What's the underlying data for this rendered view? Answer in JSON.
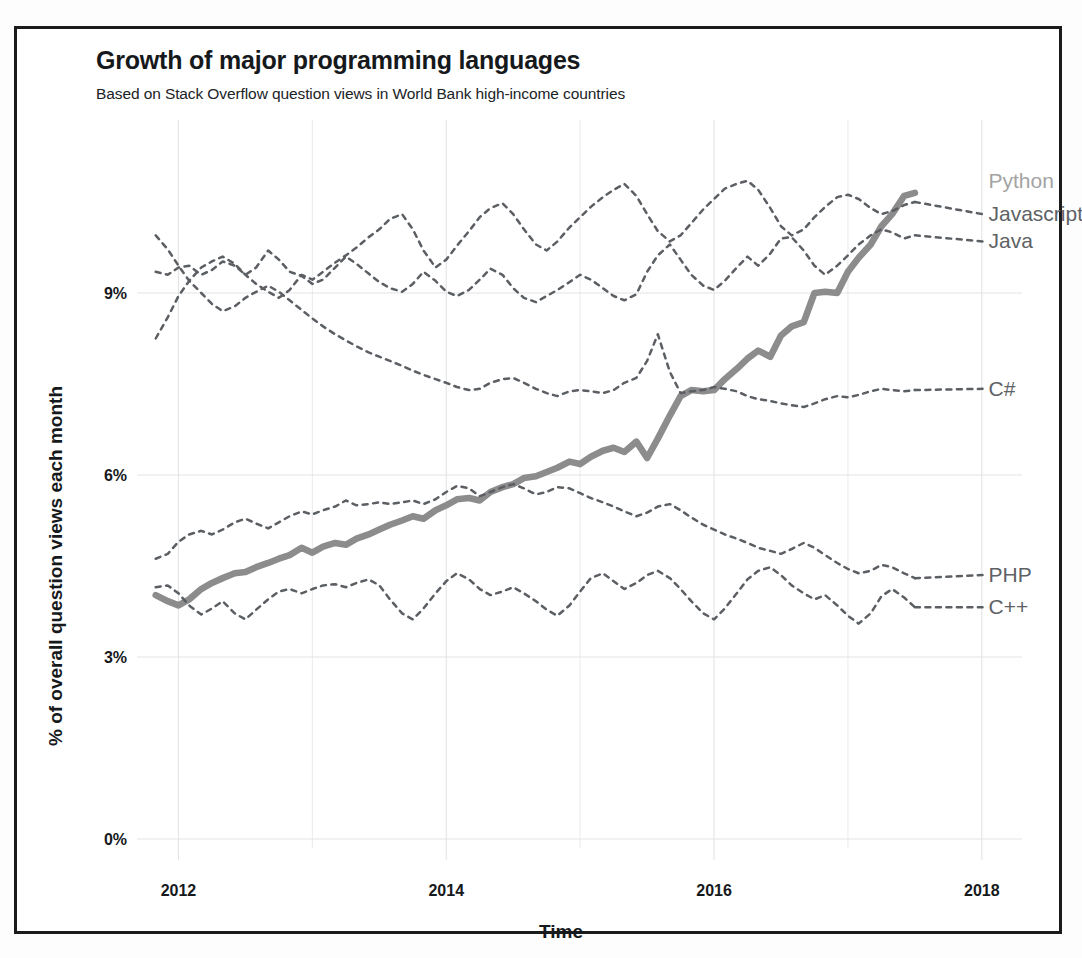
{
  "header": {
    "title": "Growth of major programming languages",
    "subtitle": "Based on Stack Overflow question views in World Bank high-income countries"
  },
  "axes": {
    "x_title": "Time",
    "y_title": "% of overall question views each month",
    "x_ticks": [
      "2012",
      "2014",
      "2016",
      "2018"
    ],
    "y_ticks": [
      "9%",
      "6%",
      "3%",
      "0%"
    ]
  },
  "series_labels": {
    "python": "Python",
    "javascript": "Javascript",
    "java": "Java",
    "csharp": "C#",
    "php": "PHP",
    "cpp": "C++"
  },
  "colors": {
    "python_line": "#8c8c8c",
    "dashed_line": "#5b5f63",
    "label_python": "#a3a3a3",
    "label_dark": "#5e6266",
    "grid": "#e4e4e6",
    "text": "#16191c",
    "frame": "#1b1b1b"
  },
  "chart_data": {
    "type": "line",
    "title": "Growth of major programming languages",
    "subtitle": "Based on Stack Overflow question views in World Bank high-income countries",
    "xlabel": "Time",
    "ylabel": "% of overall question views each month",
    "xlim": [
      2011.75,
      2018.3
    ],
    "ylim": [
      0,
      11.4
    ],
    "x_ticks": [
      2012,
      2014,
      2016,
      2018
    ],
    "x_minor_ticks": [
      2013,
      2015,
      2017
    ],
    "y_ticks": [
      0,
      3,
      6,
      9
    ],
    "grid": true,
    "legend_position": "right-inline-labels",
    "x_unit": "year (monthly samples)",
    "y_unit": "percent",
    "series": [
      {
        "name": "Python",
        "style": "solid-thick",
        "color": "#8c8c8c",
        "label_at": [
          2018.05,
          10.85
        ],
        "x": [
          2011.83,
          2011.92,
          2012.0,
          2012.08,
          2012.17,
          2012.25,
          2012.33,
          2012.42,
          2012.5,
          2012.58,
          2012.67,
          2012.75,
          2012.83,
          2012.92,
          2013.0,
          2013.08,
          2013.17,
          2013.25,
          2013.33,
          2013.42,
          2013.5,
          2013.58,
          2013.67,
          2013.75,
          2013.83,
          2013.92,
          2014.0,
          2014.08,
          2014.17,
          2014.25,
          2014.33,
          2014.42,
          2014.5,
          2014.58,
          2014.67,
          2014.75,
          2014.83,
          2014.92,
          2015.0,
          2015.08,
          2015.17,
          2015.25,
          2015.33,
          2015.42,
          2015.5,
          2015.58,
          2015.67,
          2015.75,
          2015.83,
          2015.92,
          2016.0,
          2016.08,
          2016.17,
          2016.25,
          2016.33,
          2016.42,
          2016.5,
          2016.58,
          2016.67,
          2016.75,
          2016.83,
          2016.92,
          2017.0,
          2017.08,
          2017.17,
          2017.25,
          2017.33,
          2017.42,
          2017.5
        ],
        "y": [
          4.02,
          3.92,
          3.85,
          3.95,
          4.12,
          4.22,
          4.3,
          4.38,
          4.4,
          4.48,
          4.55,
          4.62,
          4.68,
          4.8,
          4.72,
          4.82,
          4.88,
          4.85,
          4.95,
          5.02,
          5.1,
          5.18,
          5.25,
          5.32,
          5.28,
          5.42,
          5.5,
          5.6,
          5.62,
          5.58,
          5.72,
          5.8,
          5.85,
          5.95,
          5.98,
          6.05,
          6.12,
          6.22,
          6.18,
          6.3,
          6.4,
          6.45,
          6.38,
          6.55,
          6.28,
          6.6,
          6.98,
          7.3,
          7.4,
          7.38,
          7.4,
          7.58,
          7.75,
          7.92,
          8.05,
          7.95,
          8.3,
          8.45,
          8.52,
          9.0,
          9.02,
          9.0,
          9.35,
          9.58,
          9.8,
          10.1,
          10.3,
          10.6,
          10.65
        ]
      },
      {
        "name": "Javascript",
        "style": "dashed",
        "color": "#5b5f63",
        "label_at": [
          2018.05,
          10.3
        ],
        "x": [
          2011.83,
          2011.92,
          2012.0,
          2012.08,
          2012.17,
          2012.25,
          2012.33,
          2012.42,
          2012.5,
          2012.58,
          2012.67,
          2012.75,
          2012.83,
          2012.92,
          2013.0,
          2013.08,
          2013.17,
          2013.25,
          2013.33,
          2013.42,
          2013.5,
          2013.58,
          2013.67,
          2013.75,
          2013.83,
          2013.92,
          2014.0,
          2014.08,
          2014.17,
          2014.25,
          2014.33,
          2014.42,
          2014.5,
          2014.58,
          2014.67,
          2014.75,
          2014.83,
          2014.92,
          2015.0,
          2015.08,
          2015.17,
          2015.25,
          2015.33,
          2015.42,
          2015.5,
          2015.58,
          2015.67,
          2015.75,
          2015.83,
          2015.92,
          2016.0,
          2016.08,
          2016.17,
          2016.25,
          2016.33,
          2016.42,
          2016.5,
          2016.58,
          2016.67,
          2016.75,
          2016.83,
          2016.92,
          2017.0,
          2017.08,
          2017.17,
          2017.25,
          2017.33,
          2017.42,
          2017.5
        ],
        "y": [
          8.25,
          8.6,
          8.95,
          9.2,
          9.42,
          9.52,
          9.6,
          9.48,
          9.3,
          9.15,
          9.02,
          8.92,
          9.05,
          9.3,
          9.22,
          9.35,
          9.5,
          9.62,
          9.75,
          9.92,
          10.05,
          10.22,
          10.3,
          10.05,
          9.7,
          9.42,
          9.55,
          9.78,
          10.02,
          10.25,
          10.4,
          10.48,
          10.3,
          10.05,
          9.8,
          9.7,
          9.85,
          10.08,
          10.25,
          10.42,
          10.58,
          10.7,
          10.8,
          10.6,
          10.3,
          10.02,
          9.85,
          9.95,
          10.15,
          10.38,
          10.55,
          10.72,
          10.8,
          10.85,
          10.7,
          10.4,
          10.1,
          9.95,
          10.05,
          10.25,
          10.42,
          10.58,
          10.62,
          10.55,
          10.4,
          10.3,
          10.35,
          10.45,
          10.5
        ]
      },
      {
        "name": "Java",
        "style": "dashed",
        "color": "#5b5f63",
        "label_at": [
          2018.05,
          9.85
        ],
        "x": [
          2011.83,
          2011.92,
          2012.0,
          2012.08,
          2012.17,
          2012.25,
          2012.33,
          2012.42,
          2012.5,
          2012.58,
          2012.67,
          2012.75,
          2012.83,
          2012.92,
          2013.0,
          2013.08,
          2013.17,
          2013.25,
          2013.33,
          2013.42,
          2013.5,
          2013.58,
          2013.67,
          2013.75,
          2013.83,
          2013.92,
          2014.0,
          2014.08,
          2014.17,
          2014.25,
          2014.33,
          2014.42,
          2014.5,
          2014.58,
          2014.67,
          2014.75,
          2014.83,
          2014.92,
          2015.0,
          2015.08,
          2015.17,
          2015.25,
          2015.33,
          2015.42,
          2015.5,
          2015.58,
          2015.67,
          2015.75,
          2015.83,
          2015.92,
          2016.0,
          2016.08,
          2016.17,
          2016.25,
          2016.33,
          2016.42,
          2016.5,
          2016.58,
          2016.67,
          2016.75,
          2016.83,
          2016.92,
          2017.0,
          2017.08,
          2017.17,
          2017.25,
          2017.33,
          2017.42,
          2017.5
        ],
        "y": [
          9.35,
          9.3,
          9.42,
          9.45,
          9.3,
          9.38,
          9.52,
          9.45,
          9.3,
          9.42,
          9.7,
          9.55,
          9.35,
          9.28,
          9.15,
          9.22,
          9.42,
          9.6,
          9.48,
          9.32,
          9.18,
          9.08,
          9.02,
          9.15,
          9.35,
          9.2,
          9.02,
          8.95,
          9.05,
          9.22,
          9.4,
          9.3,
          9.08,
          8.92,
          8.85,
          8.95,
          9.05,
          9.18,
          9.3,
          9.22,
          9.08,
          8.95,
          8.88,
          8.98,
          9.35,
          9.62,
          9.8,
          9.55,
          9.3,
          9.12,
          9.05,
          9.2,
          9.42,
          9.6,
          9.45,
          9.65,
          9.9,
          9.92,
          9.7,
          9.45,
          9.3,
          9.45,
          9.62,
          9.8,
          9.95,
          10.05,
          10.0,
          9.9,
          9.95
        ]
      },
      {
        "name": "C#",
        "style": "dashed",
        "color": "#5b5f63",
        "label_at": [
          2018.05,
          7.42
        ],
        "x": [
          2011.83,
          2011.92,
          2012.0,
          2012.08,
          2012.17,
          2012.25,
          2012.33,
          2012.42,
          2012.5,
          2012.58,
          2012.67,
          2012.75,
          2012.83,
          2012.92,
          2013.0,
          2013.08,
          2013.17,
          2013.25,
          2013.33,
          2013.42,
          2013.5,
          2013.58,
          2013.67,
          2013.75,
          2013.83,
          2013.92,
          2014.0,
          2014.08,
          2014.17,
          2014.25,
          2014.33,
          2014.42,
          2014.5,
          2014.58,
          2014.67,
          2014.75,
          2014.83,
          2014.92,
          2015.0,
          2015.08,
          2015.17,
          2015.25,
          2015.33,
          2015.42,
          2015.5,
          2015.58,
          2015.67,
          2015.75,
          2015.83,
          2015.92,
          2016.0,
          2016.08,
          2016.17,
          2016.25,
          2016.33,
          2016.42,
          2016.5,
          2016.58,
          2016.67,
          2016.75,
          2016.83,
          2016.92,
          2017.0,
          2017.08,
          2017.17,
          2017.25,
          2017.33,
          2017.42,
          2017.5
        ],
        "y": [
          9.95,
          9.72,
          9.45,
          9.2,
          9.0,
          8.82,
          8.7,
          8.78,
          8.92,
          9.02,
          9.12,
          9.02,
          8.88,
          8.72,
          8.58,
          8.45,
          8.32,
          8.22,
          8.12,
          8.02,
          7.95,
          7.88,
          7.8,
          7.72,
          7.65,
          7.58,
          7.52,
          7.45,
          7.4,
          7.42,
          7.52,
          7.58,
          7.6,
          7.52,
          7.42,
          7.35,
          7.3,
          7.38,
          7.4,
          7.38,
          7.35,
          7.4,
          7.52,
          7.6,
          7.88,
          8.32,
          7.7,
          7.35,
          7.38,
          7.4,
          7.45,
          7.42,
          7.38,
          7.3,
          7.25,
          7.22,
          7.18,
          7.15,
          7.12,
          7.18,
          7.25,
          7.3,
          7.28,
          7.32,
          7.38,
          7.42,
          7.4,
          7.38,
          7.4
        ]
      },
      {
        "name": "PHP",
        "style": "dashed",
        "color": "#5b5f63",
        "label_at": [
          2018.05,
          4.35
        ],
        "x": [
          2011.83,
          2011.92,
          2012.0,
          2012.08,
          2012.17,
          2012.25,
          2012.33,
          2012.42,
          2012.5,
          2012.58,
          2012.67,
          2012.75,
          2012.83,
          2012.92,
          2013.0,
          2013.08,
          2013.17,
          2013.25,
          2013.33,
          2013.42,
          2013.5,
          2013.58,
          2013.67,
          2013.75,
          2013.83,
          2013.92,
          2014.0,
          2014.08,
          2014.17,
          2014.25,
          2014.33,
          2014.42,
          2014.5,
          2014.58,
          2014.67,
          2014.75,
          2014.83,
          2014.92,
          2015.0,
          2015.08,
          2015.17,
          2015.25,
          2015.33,
          2015.42,
          2015.5,
          2015.58,
          2015.67,
          2015.75,
          2015.83,
          2015.92,
          2016.0,
          2016.08,
          2016.17,
          2016.25,
          2016.33,
          2016.42,
          2016.5,
          2016.58,
          2016.67,
          2016.75,
          2016.83,
          2016.92,
          2017.0,
          2017.08,
          2017.17,
          2017.25,
          2017.33,
          2017.42,
          2017.5
        ],
        "y": [
          4.62,
          4.7,
          4.9,
          5.02,
          5.08,
          5.02,
          5.1,
          5.22,
          5.28,
          5.2,
          5.12,
          5.22,
          5.32,
          5.4,
          5.35,
          5.42,
          5.48,
          5.58,
          5.5,
          5.52,
          5.55,
          5.52,
          5.55,
          5.58,
          5.52,
          5.6,
          5.72,
          5.82,
          5.78,
          5.65,
          5.72,
          5.8,
          5.85,
          5.78,
          5.68,
          5.72,
          5.8,
          5.78,
          5.7,
          5.62,
          5.55,
          5.48,
          5.4,
          5.32,
          5.38,
          5.48,
          5.52,
          5.42,
          5.3,
          5.18,
          5.1,
          5.02,
          4.95,
          4.88,
          4.8,
          4.75,
          4.7,
          4.78,
          4.88,
          4.8,
          4.68,
          4.55,
          4.45,
          4.38,
          4.42,
          4.52,
          4.48,
          4.38,
          4.3
        ]
      },
      {
        "name": "C++",
        "style": "dashed",
        "color": "#5b5f63",
        "label_at": [
          2018.05,
          3.82
        ],
        "x": [
          2011.83,
          2011.92,
          2012.0,
          2012.08,
          2012.17,
          2012.25,
          2012.33,
          2012.42,
          2012.5,
          2012.58,
          2012.67,
          2012.75,
          2012.83,
          2012.92,
          2013.0,
          2013.08,
          2013.17,
          2013.25,
          2013.33,
          2013.42,
          2013.5,
          2013.58,
          2013.67,
          2013.75,
          2013.83,
          2013.92,
          2014.0,
          2014.08,
          2014.17,
          2014.25,
          2014.33,
          2014.42,
          2014.5,
          2014.58,
          2014.67,
          2014.75,
          2014.83,
          2014.92,
          2015.0,
          2015.08,
          2015.17,
          2015.25,
          2015.33,
          2015.42,
          2015.5,
          2015.58,
          2015.67,
          2015.75,
          2015.83,
          2015.92,
          2016.0,
          2016.08,
          2016.17,
          2016.25,
          2016.33,
          2016.42,
          2016.5,
          2016.58,
          2016.67,
          2016.75,
          2016.83,
          2016.92,
          2017.0,
          2017.08,
          2017.17,
          2017.25,
          2017.33,
          2017.42,
          2017.5
        ],
        "y": [
          4.15,
          4.18,
          4.05,
          3.85,
          3.7,
          3.8,
          3.92,
          3.72,
          3.62,
          3.78,
          3.95,
          4.08,
          4.12,
          4.05,
          4.12,
          4.18,
          4.2,
          4.15,
          4.22,
          4.28,
          4.18,
          3.95,
          3.72,
          3.62,
          3.8,
          4.05,
          4.25,
          4.38,
          4.28,
          4.12,
          4.02,
          4.08,
          4.15,
          4.05,
          3.92,
          3.78,
          3.68,
          3.85,
          4.08,
          4.3,
          4.38,
          4.25,
          4.12,
          4.22,
          4.35,
          4.42,
          4.3,
          4.12,
          3.92,
          3.72,
          3.62,
          3.8,
          4.05,
          4.28,
          4.42,
          4.48,
          4.35,
          4.18,
          4.05,
          3.95,
          4.02,
          3.85,
          3.68,
          3.55,
          3.72,
          4.0,
          4.12,
          3.98,
          3.82
        ]
      }
    ]
  }
}
